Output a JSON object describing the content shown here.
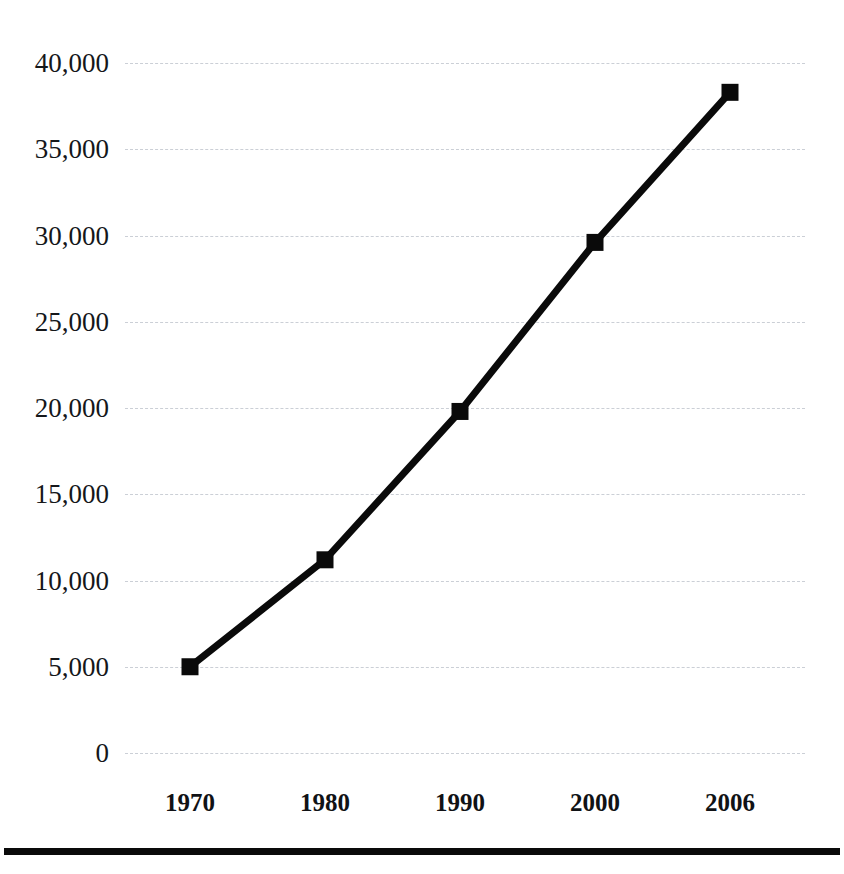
{
  "chart_data": {
    "type": "line",
    "title": "",
    "subtitle": "",
    "xlabel": "",
    "ylabel": "",
    "categories": [
      "1970",
      "1980",
      "1990",
      "2000",
      "2006"
    ],
    "x": [
      1970,
      1980,
      1990,
      2000,
      2006
    ],
    "values": [
      5000,
      11200,
      19800,
      29600,
      38300
    ],
    "series": [
      {
        "name": "",
        "values": [
          5000,
          11200,
          19800,
          29600,
          38300
        ]
      }
    ],
    "ylim": [
      0,
      40000
    ],
    "yticks": [
      0,
      5000,
      10000,
      15000,
      20000,
      25000,
      30000,
      35000,
      40000
    ],
    "ytick_labels": [
      "0",
      "5,000",
      "10,000",
      "15,000",
      "20,000",
      "25,000",
      "30,000",
      "35,000",
      "40,000"
    ],
    "xtick_labels": [
      "1970",
      "1980",
      "1990",
      "2000",
      "2006"
    ],
    "grid": true,
    "grid_style": "dashed",
    "legend": false,
    "legend_position": "none",
    "marker": "square",
    "annotations": []
  },
  "style": {
    "line_color": "#0a0a0a",
    "marker_color": "#0a0a0a",
    "grid_color": "#c9cdd4",
    "text_color": "#15171a",
    "background": "#ffffff",
    "rule_color": "#0a0a0a"
  },
  "geometry": {
    "plot_left": 125,
    "plot_right": 805,
    "y_zero_px": 753,
    "px_per_5000": 86.25,
    "marker_x": [
      190,
      325,
      460,
      595,
      730
    ],
    "xlabel_y": 790,
    "rule_y": 848
  }
}
